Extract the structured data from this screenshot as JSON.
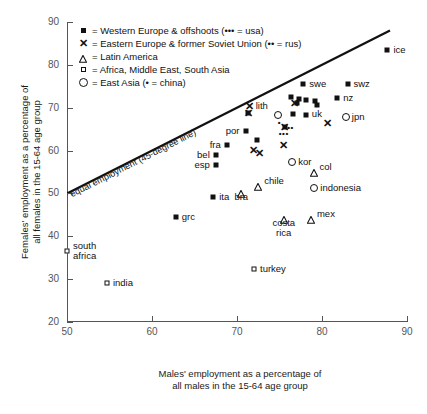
{
  "chart_data": {
    "type": "scatter",
    "title": "",
    "xlabel": "Males' employment as a percentage of all males in the 15-64 age group",
    "xlabel_line1": "Males' employment as a percentage of",
    "xlabel_line2": "all males in the 15-64 age group",
    "ylabel": "Females' employment as a percentage of all females in the 15-64 age group",
    "ylabel_line1": "Females' employment as a percentage of",
    "ylabel_line2": "all females in the 15-64 age group",
    "xlim": [
      50,
      90
    ],
    "ylim": [
      20,
      90
    ],
    "xticks": [
      50,
      60,
      70,
      80,
      90
    ],
    "yticks": [
      20,
      30,
      40,
      50,
      60,
      70,
      80,
      90
    ],
    "grid": false,
    "legend_position": "top-left",
    "reference_line": {
      "label": "equal employment (45-degree line)",
      "type": "identity",
      "from": [
        50,
        50
      ],
      "to": [
        88,
        88
      ]
    },
    "legend": [
      {
        "marker": "filled-square",
        "label": "= Western Europe & offshoots (••• = usa)"
      },
      {
        "marker": "x-cross",
        "label": "= Eastern Europe & former Soviet Union (•• = rus)"
      },
      {
        "marker": "triangle",
        "label": "= Latin America"
      },
      {
        "marker": "open-square",
        "label": "= Africa, Middle East, South Asia"
      },
      {
        "marker": "open-circle",
        "label": "= East Asia (• = china)"
      }
    ],
    "series": [
      {
        "name": "Western Europe & offshoots",
        "marker": "filled-square",
        "points": [
          {
            "label": "ice",
            "x": 87.7,
            "y": 83.5,
            "lpos": "right"
          },
          {
            "label": "swe",
            "x": 77.8,
            "y": 75.6,
            "lpos": "right"
          },
          {
            "label": "swz",
            "x": 83.0,
            "y": 75.6,
            "lpos": "right"
          },
          {
            "label": "nz",
            "x": 81.8,
            "y": 72.2,
            "lpos": "right"
          },
          {
            "label": "",
            "x": 76.4,
            "y": 72.6,
            "lpos": "none"
          },
          {
            "label": "",
            "x": 77.0,
            "y": 71.0,
            "lpos": "none"
          },
          {
            "label": "",
            "x": 77.3,
            "y": 72.0,
            "lpos": "none"
          },
          {
            "label": "",
            "x": 78.1,
            "y": 71.7,
            "lpos": "none"
          },
          {
            "label": "",
            "x": 79.2,
            "y": 71.5,
            "lpos": "none"
          },
          {
            "label": "uk",
            "x": 79.4,
            "y": 70.6,
            "lpos": "below"
          },
          {
            "label": "",
            "x": 76.6,
            "y": 68.5,
            "lpos": "none"
          },
          {
            "label": "",
            "x": 78.1,
            "y": 68.4,
            "lpos": "none"
          },
          {
            "label": "",
            "x": 71.3,
            "y": 68.8,
            "lpos": "none"
          },
          {
            "label": "por",
            "x": 71.0,
            "y": 64.6,
            "lpos": "left"
          },
          {
            "label": "",
            "x": 75.6,
            "y": 65.4,
            "lpos": "none"
          },
          {
            "label": "",
            "x": 72.4,
            "y": 62.4,
            "lpos": "none"
          },
          {
            "label": "fra",
            "x": 68.8,
            "y": 61.2,
            "lpos": "left"
          },
          {
            "label": "bel",
            "x": 67.5,
            "y": 58.9,
            "lpos": "left"
          },
          {
            "label": "esp",
            "x": 67.5,
            "y": 56.6,
            "lpos": "left"
          },
          {
            "label": "ita",
            "x": 67.2,
            "y": 49.2,
            "lpos": "right"
          },
          {
            "label": "grc",
            "x": 62.8,
            "y": 44.5,
            "lpos": "right"
          }
        ]
      },
      {
        "name": "Eastern Europe & former Soviet Union",
        "marker": "x-cross",
        "points": [
          {
            "label": "lith",
            "x": 71.5,
            "y": 70.4,
            "lpos": "right"
          },
          {
            "label": "",
            "x": 71.4,
            "y": 68.7,
            "lpos": "none"
          },
          {
            "label": "",
            "x": 76.8,
            "y": 70.9,
            "lpos": "none"
          },
          {
            "label": "",
            "x": 80.6,
            "y": 66.4,
            "lpos": "none"
          },
          {
            "label": "rus",
            "x": 75.6,
            "y": 65.4,
            "lpos": "none"
          },
          {
            "label": "",
            "x": 75.5,
            "y": 61.2,
            "lpos": "none"
          },
          {
            "label": "",
            "x": 71.9,
            "y": 60.1,
            "lpos": "none"
          },
          {
            "label": "",
            "x": 72.6,
            "y": 59.4,
            "lpos": "none"
          }
        ]
      },
      {
        "name": "Latin America",
        "marker": "triangle",
        "points": [
          {
            "label": "chile",
            "x": 72.5,
            "y": 52.8,
            "lpos": "right"
          },
          {
            "label": "bra",
            "x": 70.5,
            "y": 51.3,
            "lpos": "below"
          },
          {
            "label": "col",
            "x": 79.0,
            "y": 56.2,
            "lpos": "right"
          },
          {
            "label": "costa rica",
            "x": 75.5,
            "y": 45.2,
            "lpos": "below"
          },
          {
            "label": "mex",
            "x": 78.7,
            "y": 45.2,
            "lpos": "right"
          }
        ]
      },
      {
        "name": "Africa, Middle East, South Asia",
        "marker": "open-square",
        "points": [
          {
            "label": "south africa",
            "x": 50.0,
            "y": 36.5,
            "lpos": "right"
          },
          {
            "label": "india",
            "x": 54.7,
            "y": 29.0,
            "lpos": "right"
          },
          {
            "label": "turkey",
            "x": 72.0,
            "y": 32.4,
            "lpos": "right"
          }
        ]
      },
      {
        "name": "East Asia",
        "marker": "open-circle",
        "points": [
          {
            "label": "jpn",
            "x": 82.8,
            "y": 67.8,
            "lpos": "right"
          },
          {
            "label": "kor",
            "x": 76.5,
            "y": 57.3,
            "lpos": "right"
          },
          {
            "label": "indonesia",
            "x": 79.1,
            "y": 51.2,
            "lpos": "right"
          },
          {
            "label": "china",
            "x": 74.8,
            "y": 68.3,
            "lpos": "none"
          }
        ]
      }
    ],
    "special_annotations": [
      {
        "label": "usa-dots",
        "symbol": "•••",
        "x": 75.5,
        "y": 64.2
      },
      {
        "label": "rus-dots",
        "symbol": "••",
        "x": 76.3,
        "y": 65.5
      },
      {
        "label": "china-dot",
        "symbol": "•",
        "x": 75.0,
        "y": 66.6
      }
    ]
  }
}
